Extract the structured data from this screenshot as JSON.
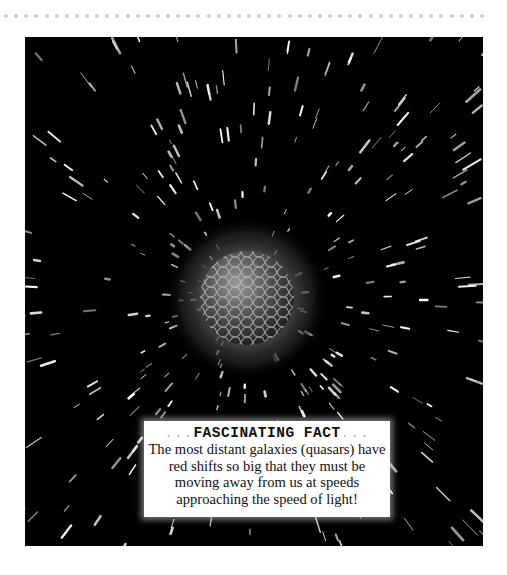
{
  "page": {
    "decoration": {
      "dot_count": 48,
      "dot_color": "#cfcfcf"
    },
    "illustration": {
      "subject": "quasar-planet-in-starfield",
      "background_color": "#000000",
      "planet": {
        "cx": 222,
        "cy": 261,
        "r": 47,
        "glow_r": 82
      }
    },
    "fact_box": {
      "title_prefix": "...",
      "title": "FASCINATING FACT",
      "title_suffix": "...",
      "text": "The most distant galaxies (quasars) have red shifts so big that they must be moving away from us at speeds approaching the speed of light!"
    }
  }
}
